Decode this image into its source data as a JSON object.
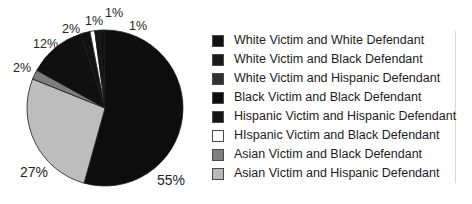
{
  "chart_data": {
    "type": "pie",
    "title": "",
    "categories": [
      "White Victim and White Defendant",
      "White Victim and Black Defendant",
      "White Victim and Hispanic Defendant",
      "Black Victim and Black Defendant",
      "Hispanic Victim and Hispanic Defendant",
      "HIspanic Victim and Black Defendant",
      "Asian Victim and Black Defendant",
      "Asian Victim and Hispanic Defendant"
    ],
    "values": [
      55,
      27,
      2,
      12,
      2,
      1,
      1,
      1
    ],
    "value_labels": [
      "55%",
      "27%",
      "2%",
      "12%",
      "2%",
      "1%",
      "1%",
      "1%"
    ],
    "colors": [
      "#0d0d0d",
      "#bdbdbd",
      "#7d7d7d",
      "#101010",
      "#121212",
      "#ffffff",
      "#141414",
      "#121212"
    ],
    "legend_position": "right",
    "grid": false
  },
  "pie": {
    "labels": [
      {
        "text": "55%",
        "x": 157,
        "y": 173,
        "size": "big"
      },
      {
        "text": "27%",
        "x": 20,
        "y": 165,
        "size": "big"
      },
      {
        "text": "2%",
        "x": 13,
        "y": 62,
        "size": "small"
      },
      {
        "text": "12%",
        "x": 33,
        "y": 38,
        "size": "small"
      },
      {
        "text": "2%",
        "x": 62,
        "y": 23,
        "size": "small"
      },
      {
        "text": "1%",
        "x": 85,
        "y": 15,
        "size": "small"
      },
      {
        "text": "1%",
        "x": 105,
        "y": 7,
        "size": "small"
      },
      {
        "text": "1%",
        "x": 129,
        "y": 20,
        "size": "small"
      }
    ]
  },
  "legend": {
    "items": [
      {
        "label": "White Victim and White Defendant",
        "color": "#121212"
      },
      {
        "label": "White Victim and Black Defendant",
        "color": "#1b1b1b"
      },
      {
        "label": "White Victim and Hispanic Defendant",
        "color": "#313131"
      },
      {
        "label": "Black Victim and Black Defendant",
        "color": "#0d0d0d"
      },
      {
        "label": "Hispanic Victim and Hispanic Defendant",
        "color": "#141414"
      },
      {
        "label": "HIspanic Victim and Black Defendant",
        "color": "#ffffff"
      },
      {
        "label": "Asian Victim and Black Defendant",
        "color": "#808080"
      },
      {
        "label": "Asian Victim and Hispanic Defendant",
        "color": "#b9b9b9"
      }
    ]
  }
}
